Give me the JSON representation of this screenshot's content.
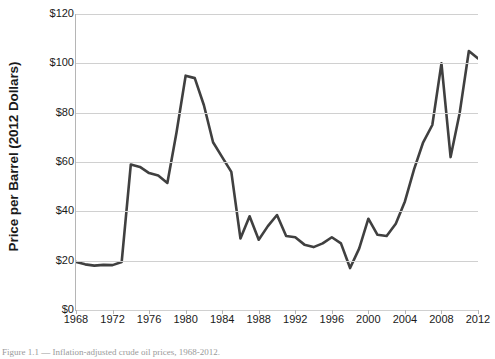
{
  "figure": {
    "caption": "Figure 1.1 — Inflation-adjusted crude oil prices, 1968-2012."
  },
  "axes": {
    "ylabel": "Price per Barrel (2012 Dollars)",
    "xlabel": "",
    "yticks": [
      "$0",
      "$20",
      "$40",
      "$60",
      "$80",
      "$100",
      "$120"
    ],
    "xticks": [
      "1968",
      "1972",
      "1976",
      "1980",
      "1984",
      "1988",
      "1992",
      "1996",
      "2000",
      "2004",
      "2008",
      "2012"
    ]
  },
  "style": {
    "line_color": "#404040",
    "grid_color": "#d0d0d0",
    "axis_color": "#b5b5b5",
    "background": "#ffffff"
  },
  "chart_data": {
    "type": "line",
    "title": "",
    "xlabel": "",
    "ylabel": "Price per Barrel (2012 Dollars)",
    "xlim": [
      1968,
      2012
    ],
    "ylim": [
      0,
      120
    ],
    "ytick_values": [
      0,
      20,
      40,
      60,
      80,
      100,
      120
    ],
    "xtick_values": [
      1968,
      1972,
      1976,
      1980,
      1984,
      1988,
      1992,
      1996,
      2000,
      2004,
      2008,
      2012
    ],
    "grid": "horizontal",
    "legend": "none",
    "x": [
      1968,
      1969,
      1970,
      1971,
      1972,
      1973,
      1974,
      1975,
      1976,
      1977,
      1978,
      1979,
      1980,
      1981,
      1982,
      1983,
      1984,
      1985,
      1986,
      1987,
      1988,
      1989,
      1990,
      1991,
      1992,
      1993,
      1994,
      1995,
      1996,
      1997,
      1998,
      1999,
      2000,
      2001,
      2002,
      2003,
      2004,
      2005,
      2006,
      2007,
      2008,
      2009,
      2010,
      2011,
      2012
    ],
    "series": [
      {
        "name": "Price per barrel (2012 dollars)",
        "values": [
          19.5,
          18.5,
          18.0,
          18.3,
          18.2,
          19.5,
          59.0,
          58.0,
          55.5,
          54.5,
          51.5,
          72.0,
          95.0,
          94.0,
          83.0,
          68.0,
          62.0,
          56.0,
          29.0,
          38.0,
          28.5,
          34.0,
          38.5,
          30.0,
          29.5,
          26.5,
          25.5,
          27.0,
          29.5,
          27.0,
          17.0,
          25.0,
          37.0,
          30.5,
          30.0,
          35.0,
          44.0,
          57.0,
          68.0,
          75.0,
          100.0,
          62.0,
          80.0,
          105.0,
          102.0
        ]
      }
    ]
  }
}
